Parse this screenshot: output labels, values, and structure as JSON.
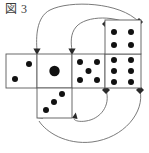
{
  "figure": {
    "caption": "図 3",
    "stroke_color": "#5a5a5a",
    "pip_color": "#111111",
    "arrow_color": "#6b6b6b",
    "background_color": "#ffffff"
  },
  "net": {
    "cell_size": 35,
    "faces": [
      {
        "id": "face-two",
        "pips": 2,
        "col": 0,
        "row": 1,
        "x": 6,
        "y": 54,
        "w": 31,
        "h": 34,
        "pip_layout": "diagonal-2",
        "pip_radius": 3
      },
      {
        "id": "face-one",
        "pips": 1,
        "col": 1,
        "row": 1,
        "x": 37,
        "y": 54,
        "w": 35,
        "h": 34,
        "pip_layout": "center-1",
        "pip_radius": 5
      },
      {
        "id": "face-five",
        "pips": 5,
        "col": 2,
        "row": 1,
        "x": 72,
        "y": 54,
        "w": 33,
        "h": 34,
        "pip_layout": "quincunx-5",
        "pip_radius": 3
      },
      {
        "id": "face-six",
        "pips": 6,
        "col": 3,
        "row": 1,
        "x": 105,
        "y": 54,
        "w": 36,
        "h": 34,
        "pip_layout": "two-by-three-6",
        "pip_radius": 3
      },
      {
        "id": "face-four",
        "pips": 4,
        "col": 3,
        "row": 0,
        "x": 105,
        "y": 20,
        "w": 36,
        "h": 34,
        "pip_layout": "corners-4",
        "pip_radius": 3
      },
      {
        "id": "face-three",
        "pips": 3,
        "col": 1,
        "row": 2,
        "x": 37,
        "y": 88,
        "w": 35,
        "h": 30,
        "pip_layout": "diagonal-3",
        "pip_radius": 3
      }
    ],
    "pip_counts_label": [
      2,
      1,
      5,
      6,
      4,
      3
    ]
  },
  "arrows": [
    {
      "id": "arrow-outer-top",
      "from": "face-four-top-right",
      "to": "face-one-top-left",
      "direction": "counterclockwise"
    },
    {
      "id": "arrow-inner-top",
      "from": "face-four-top-left",
      "to": "face-five-top-left",
      "direction": "counterclockwise"
    },
    {
      "id": "arrow-outer-bottom",
      "from": "face-six-bottom-right",
      "to": "face-three-bottom-left",
      "direction": "clockwise"
    },
    {
      "id": "arrow-inner-bottom",
      "from": "face-six-bottom-left",
      "to": "face-three-bottom-right",
      "direction": "clockwise"
    }
  ]
}
